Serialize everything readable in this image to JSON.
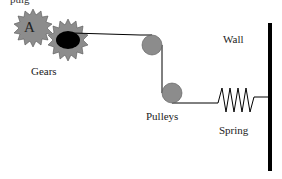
{
  "diagram": {
    "top_fragment": "pulg",
    "gear_a_label": "A",
    "labels": {
      "gears": "Gears",
      "pulleys": "Pulleys",
      "spring": "Spring",
      "wall": "Wall"
    },
    "colors": {
      "gear_fill": "#8c8c8c",
      "pulley_fill": "#8c8c8c",
      "line": "#000000",
      "wall": "#000000"
    }
  }
}
